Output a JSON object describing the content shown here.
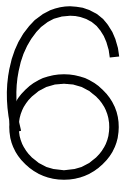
{
  "canvas": {
    "width": 133,
    "height": 188,
    "background_color": "#FFFFFF"
  },
  "glyph": {
    "character": "6",
    "name": "digit-six",
    "description": "Large black numeral six",
    "color": "#000000",
    "stroke_width": 9.5,
    "style": "thin-stroke outline, closed lower bowl, open upper arc with flat cut terminal at upper right",
    "bounds": {
      "left": 8,
      "top": 11,
      "right": 119,
      "bottom": 179
    },
    "bowl": {
      "center_x": 64,
      "center_y": 127,
      "radius_x": 50,
      "radius_y": 48
    },
    "terminal": {
      "x": 111,
      "y": 57,
      "cut": "horizontal"
    }
  }
}
